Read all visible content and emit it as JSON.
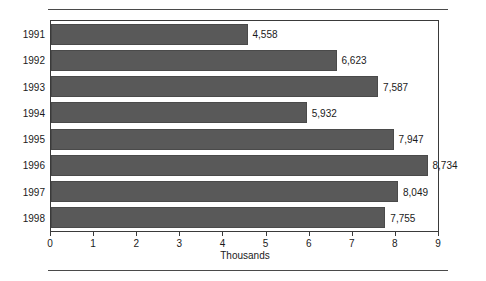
{
  "chart_data": {
    "type": "bar",
    "orientation": "horizontal",
    "title": "",
    "subtitle": "",
    "xlabel": "Thousands",
    "ylabel": "",
    "categories": [
      "1991",
      "1992",
      "1993",
      "1994",
      "1995",
      "1996",
      "1997",
      "1998"
    ],
    "values": [
      4558,
      6623,
      7587,
      5932,
      7947,
      8734,
      8049,
      7755
    ],
    "value_labels": [
      "4,558",
      "6,623",
      "7,587",
      "5,932",
      "7,947",
      "8,734",
      "8,049",
      "7,755"
    ],
    "value_scale": 1000,
    "xlim": [
      0,
      9
    ],
    "xticks": [
      0,
      1,
      2,
      3,
      4,
      5,
      6,
      7,
      8,
      9
    ],
    "xtick_labels": [
      "0",
      "1",
      "2",
      "3",
      "4",
      "5",
      "6",
      "7",
      "8",
      "9"
    ],
    "grid": false,
    "legend": null,
    "series": [
      {
        "name": "",
        "values": [
          4558,
          6623,
          7587,
          5932,
          7947,
          8734,
          8049,
          7755
        ]
      }
    ],
    "colors": {
      "bar_fill": "#595959",
      "bar_edge": "#4a4a4a",
      "plot_border": "#3a3a3a",
      "rule": "#4a4a4a",
      "text": "#1a1a1a",
      "background": "#ffffff"
    }
  }
}
